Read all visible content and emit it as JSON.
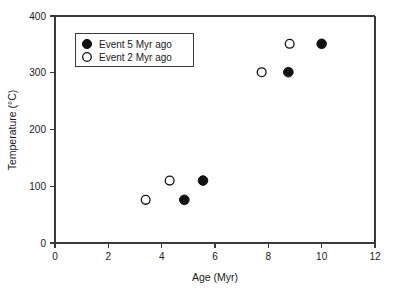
{
  "chart_data": {
    "type": "scatter",
    "title": "",
    "xlabel": "Age (Myr)",
    "ylabel": "Temperature (°C)",
    "xlim": [
      0,
      12
    ],
    "ylim": [
      0,
      400
    ],
    "xticks": [
      0,
      2,
      4,
      6,
      8,
      10,
      12
    ],
    "yticks": [
      0,
      100,
      200,
      300,
      400
    ],
    "xtick_labels": [
      "0",
      "2",
      "4",
      "6",
      "8",
      "10",
      "12"
    ],
    "ytick_labels": [
      "0",
      "100",
      "200",
      "300",
      "400"
    ],
    "grid": false,
    "legend_position": "upper left",
    "series": [
      {
        "name": "Event 5 Myr ago",
        "marker": "filled-circle",
        "color": "#111111",
        "points": [
          {
            "x": 4.85,
            "y": 76
          },
          {
            "x": 5.55,
            "y": 110
          },
          {
            "x": 8.75,
            "y": 301
          },
          {
            "x": 10.0,
            "y": 351
          }
        ]
      },
      {
        "name": "Event 2 Myr ago",
        "marker": "open-circle",
        "color": "#ffffff",
        "points": [
          {
            "x": 3.4,
            "y": 76
          },
          {
            "x": 4.3,
            "y": 110
          },
          {
            "x": 7.75,
            "y": 301
          },
          {
            "x": 8.8,
            "y": 351
          }
        ]
      }
    ]
  },
  "legend": {
    "entries": [
      {
        "label": "Event 5 Myr ago",
        "marker": "filled-circle"
      },
      {
        "label": "Event 2 Myr ago",
        "marker": "open-circle"
      }
    ]
  }
}
